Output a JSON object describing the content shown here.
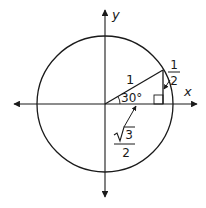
{
  "diagram": {
    "axes": {
      "x_label": "x",
      "y_label": "y"
    },
    "labels": {
      "hypotenuse": "1",
      "angle": "30°",
      "opposite_num": "1",
      "opposite_den": "2",
      "adjacent_num": "3",
      "adjacent_den": "2"
    },
    "colors": {
      "stroke": "#1a1a1a",
      "background": "#ffffff"
    }
  }
}
